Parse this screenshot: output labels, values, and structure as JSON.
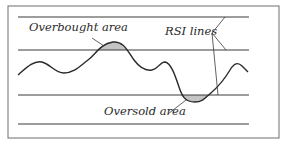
{
  "diagram": {
    "labels": {
      "overbought": "Overbought area",
      "oversold": "Oversold area",
      "rsi_lines": "RSI lines"
    },
    "colors": {
      "border": "#6e6e6e",
      "lines": "#3a3a3a",
      "curve": "#2a2a2a",
      "shaded_area": "#c4c4c4",
      "background": "#ffffff"
    },
    "horizontal_lines_y": [
      17,
      50,
      95,
      124
    ]
  }
}
